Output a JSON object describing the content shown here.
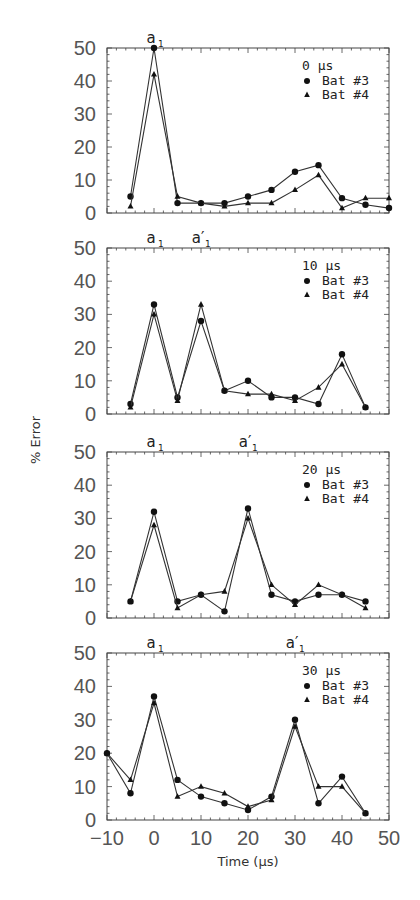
{
  "chart_data": [
    {
      "type": "line",
      "panel_label": "0 µs",
      "xlabel": "Time (µs)",
      "ylabel": "% Error",
      "xlim": [
        -10,
        50
      ],
      "ylim": [
        0,
        50
      ],
      "yticks": [
        0,
        10,
        20,
        30,
        40,
        50
      ],
      "markers": [
        {
          "label": "a",
          "sub": "1",
          "prime": false,
          "x": 0
        }
      ],
      "series": [
        {
          "name": "Bat #3",
          "marker": "circle",
          "x": [
            -5,
            0,
            5,
            10,
            15,
            20,
            25,
            30,
            35,
            40,
            45,
            50
          ],
          "values": [
            5,
            50,
            3,
            3,
            3,
            5,
            7,
            12.5,
            14.5,
            4.5,
            2.5,
            1.5
          ]
        },
        {
          "name": "Bat #4",
          "marker": "triangle",
          "x": [
            -5,
            0,
            5,
            10,
            15,
            20,
            25,
            30,
            35,
            40,
            45,
            50
          ],
          "values": [
            2,
            42,
            5,
            3,
            2,
            3,
            3,
            7,
            11.5,
            1.5,
            4.5,
            4.5
          ]
        }
      ]
    },
    {
      "type": "line",
      "panel_label": "10 µs",
      "xlabel": "Time (µs)",
      "ylabel": "% Error",
      "xlim": [
        -10,
        50
      ],
      "ylim": [
        0,
        50
      ],
      "yticks": [
        0,
        10,
        20,
        30,
        40,
        50
      ],
      "markers": [
        {
          "label": "a",
          "sub": "1",
          "prime": false,
          "x": 0
        },
        {
          "label": "a",
          "sub": "1",
          "prime": true,
          "x": 10
        }
      ],
      "series": [
        {
          "name": "Bat #3",
          "marker": "circle",
          "x": [
            -5,
            0,
            5,
            10,
            15,
            20,
            25,
            30,
            35,
            40,
            45
          ],
          "values": [
            3,
            33,
            5,
            28,
            7,
            10,
            5,
            5,
            3,
            18,
            2
          ]
        },
        {
          "name": "Bat #4",
          "marker": "triangle",
          "x": [
            -5,
            0,
            5,
            10,
            15,
            20,
            25,
            30,
            35,
            40,
            45
          ],
          "values": [
            2,
            30,
            4,
            33,
            7,
            6,
            6,
            4,
            8,
            15,
            2
          ]
        }
      ]
    },
    {
      "type": "line",
      "panel_label": "20 µs",
      "xlabel": "Time (µs)",
      "ylabel": "% Error",
      "xlim": [
        -10,
        50
      ],
      "ylim": [
        0,
        50
      ],
      "yticks": [
        0,
        10,
        20,
        30,
        40,
        50
      ],
      "markers": [
        {
          "label": "a",
          "sub": "1",
          "prime": false,
          "x": 0
        },
        {
          "label": "a",
          "sub": "1",
          "prime": true,
          "x": 20
        }
      ],
      "series": [
        {
          "name": "Bat #3",
          "marker": "circle",
          "x": [
            -5,
            0,
            5,
            10,
            15,
            20,
            25,
            30,
            35,
            40,
            45
          ],
          "values": [
            5,
            32,
            5,
            7,
            2,
            33,
            7,
            5,
            7,
            7,
            5
          ]
        },
        {
          "name": "Bat #4",
          "marker": "triangle",
          "x": [
            -5,
            0,
            5,
            10,
            15,
            20,
            25,
            30,
            35,
            40,
            45
          ],
          "values": [
            5,
            28,
            3,
            7,
            8,
            30,
            10,
            4,
            10,
            7,
            3
          ]
        }
      ]
    },
    {
      "type": "line",
      "panel_label": "30 µs",
      "xlabel": "Time (µs)",
      "ylabel": "% Error",
      "xlim": [
        -10,
        50
      ],
      "ylim": [
        0,
        50
      ],
      "yticks": [
        0,
        10,
        20,
        30,
        40,
        50
      ],
      "xticks": [
        -10,
        0,
        10,
        20,
        30,
        40,
        50
      ],
      "markers": [
        {
          "label": "a",
          "sub": "1",
          "prime": false,
          "x": 0
        },
        {
          "label": "a",
          "sub": "1",
          "prime": true,
          "x": 30
        }
      ],
      "series": [
        {
          "name": "Bat #3",
          "marker": "circle",
          "x": [
            -10,
            -5,
            0,
            5,
            10,
            15,
            20,
            25,
            30,
            35,
            40,
            45
          ],
          "values": [
            20,
            8,
            37,
            12,
            7,
            5,
            3,
            7,
            30,
            5,
            13,
            2
          ]
        },
        {
          "name": "Bat #4",
          "marker": "triangle",
          "x": [
            -10,
            -5,
            0,
            5,
            10,
            15,
            20,
            25,
            30,
            35,
            40,
            45
          ],
          "values": [
            20,
            12,
            35,
            7,
            10,
            8,
            4,
            6,
            28,
            10,
            10,
            2
          ]
        }
      ]
    }
  ],
  "figure": {
    "ylabel": "% Error",
    "xlabel": "Time (µs)",
    "xtick_labels": [
      "−10",
      "0",
      "10",
      "20",
      "30",
      "40",
      "50"
    ],
    "ytick_labels": [
      "0",
      "10",
      "20",
      "30",
      "40",
      "50"
    ],
    "legend": [
      {
        "label": "Bat #3",
        "marker": "circle"
      },
      {
        "label": "Bat #4",
        "marker": "triangle"
      }
    ],
    "colors": {
      "line": "#333333",
      "axis": "#444444",
      "text": "#555555",
      "background": "#ffffff"
    }
  }
}
